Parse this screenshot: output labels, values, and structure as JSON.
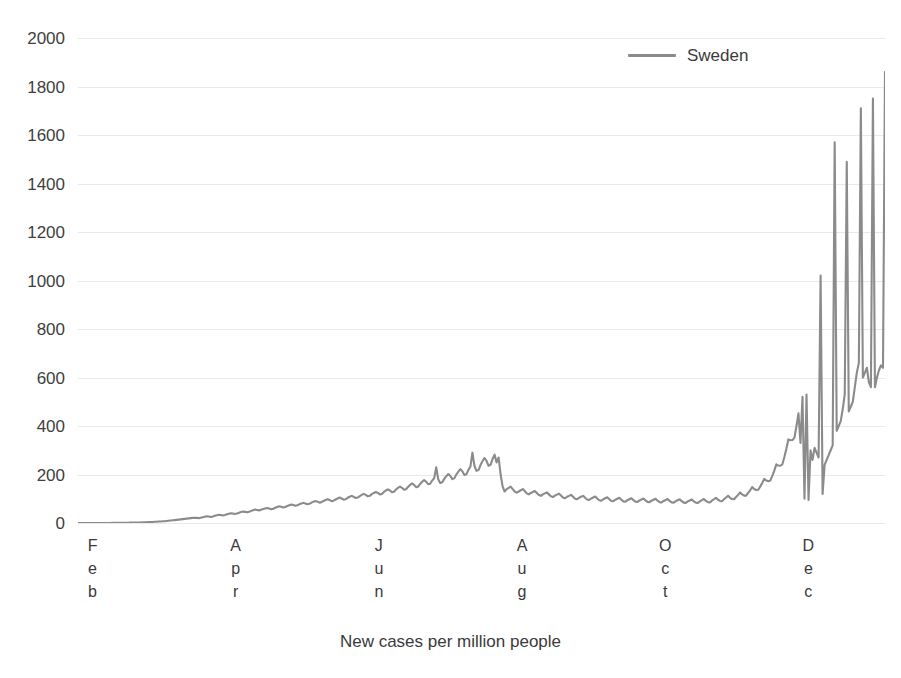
{
  "chart_data": {
    "type": "line",
    "title": "",
    "xlabel": "New cases per million people",
    "ylabel": "",
    "ylim": [
      0,
      2000
    ],
    "ytick_step": 200,
    "yticks": [
      "2000",
      "1800",
      "1600",
      "1400",
      "1200",
      "1000",
      "800",
      "600",
      "400",
      "200",
      "0"
    ],
    "grid": true,
    "legend_position": "top-right",
    "x_tick_labels": [
      "Feb",
      "Apr",
      "Jun",
      "Aug",
      "Oct",
      "Dec"
    ],
    "x_tick_stacked_letters": [
      [
        "F",
        "e",
        "b"
      ],
      [
        "A",
        "p",
        "r"
      ],
      [
        "J",
        "u",
        "n"
      ],
      [
        "A",
        "u",
        "g"
      ],
      [
        "O",
        "c",
        "t"
      ],
      [
        "D",
        "e",
        "c"
      ]
    ],
    "x_range_note": "Feb 2020 through late Dec 2020, daily values",
    "series": [
      {
        "name": "Sweden",
        "color": "#8b8b8b",
        "values": [
          0,
          0,
          0,
          0,
          0,
          0,
          0,
          0,
          0,
          0,
          0,
          0,
          0,
          0,
          0,
          0,
          0,
          1,
          1,
          1,
          1,
          1,
          1,
          1,
          1,
          1,
          2,
          2,
          2,
          2,
          2,
          2,
          3,
          3,
          3,
          4,
          4,
          4,
          5,
          5,
          6,
          6,
          7,
          7,
          8,
          9,
          10,
          11,
          12,
          13,
          14,
          15,
          16,
          17,
          18,
          19,
          20,
          21,
          22,
          21,
          20,
          22,
          24,
          26,
          28,
          27,
          25,
          27,
          30,
          32,
          34,
          33,
          31,
          33,
          36,
          38,
          40,
          39,
          37,
          39,
          42,
          45,
          47,
          46,
          44,
          46,
          50,
          53,
          56,
          54,
          52,
          55,
          58,
          60,
          62,
          60,
          57,
          59,
          63,
          66,
          69,
          67,
          64,
          66,
          70,
          73,
          76,
          74,
          71,
          73,
          77,
          80,
          83,
          80,
          77,
          79,
          84,
          88,
          91,
          88,
          84,
          86,
          91,
          95,
          98,
          95,
          90,
          92,
          97,
          101,
          105,
          101,
          96,
          98,
          104,
          108,
          112,
          108,
          103,
          105,
          111,
          116,
          120,
          116,
          110,
          112,
          119,
          124,
          128,
          124,
          118,
          120,
          128,
          134,
          139,
          134,
          127,
          129,
          138,
          145,
          150,
          145,
          137,
          139,
          149,
          157,
          163,
          157,
          148,
          150,
          161,
          170,
          177,
          170,
          160,
          162,
          175,
          185,
          230,
          180,
          165,
          168,
          182,
          193,
          202,
          194,
          181,
          184,
          200,
          212,
          222,
          213,
          198,
          201,
          219,
          233,
          290,
          235,
          215,
          218,
          239,
          255,
          268,
          256,
          236,
          240,
          264,
          282,
          250,
          270,
          200,
          150,
          130,
          140,
          145,
          150,
          140,
          130,
          125,
          130,
          135,
          140,
          132,
          122,
          118,
          124,
          128,
          132,
          124,
          115,
          112,
          118,
          122,
          126,
          118,
          110,
          107,
          113,
          117,
          121,
          113,
          105,
          102,
          108,
          112,
          116,
          108,
          100,
          98,
          104,
          108,
          112,
          104,
          97,
          95,
          101,
          105,
          109,
          101,
          94,
          92,
          98,
          102,
          106,
          98,
          91,
          90,
          96,
          100,
          104,
          96,
          89,
          88,
          94,
          98,
          102,
          94,
          88,
          87,
          93,
          97,
          101,
          93,
          87,
          86,
          92,
          96,
          100,
          92,
          86,
          85,
          91,
          95,
          99,
          91,
          85,
          84,
          90,
          94,
          98,
          90,
          84,
          83,
          89,
          93,
          97,
          89,
          84,
          83,
          89,
          94,
          99,
          91,
          86,
          85,
          92,
          98,
          104,
          96,
          91,
          90,
          98,
          105,
          112,
          104,
          99,
          98,
          107,
          116,
          126,
          118,
          113,
          113,
          124,
          135,
          148,
          140,
          136,
          137,
          150,
          165,
          182,
          175,
          172,
          175,
          194,
          216,
          242,
          237,
          236,
          242,
          272,
          306,
          345,
          341,
          342,
          352,
          399,
          452,
          330,
          520,
          100,
          530,
          95,
          300,
          260,
          310,
          290,
          270,
          1020,
          120,
          240,
          260,
          280,
          300,
          320,
          1570,
          380,
          400,
          420,
          470,
          530,
          1490,
          460,
          480,
          500,
          560,
          620,
          660,
          1710,
          600,
          620,
          640,
          580,
          560,
          1750,
          560,
          600,
          630,
          650,
          640,
          1860
        ]
      }
    ],
    "peaks_noted": [
      {
        "label": "late June spike",
        "value": 290
      },
      {
        "label": "Nov spike",
        "value": 1020
      },
      {
        "label": "Dec spike 1",
        "value": 1570
      },
      {
        "label": "Dec spike 2",
        "value": 1490
      },
      {
        "label": "Dec spike 3",
        "value": 1710
      },
      {
        "label": "Dec spike 4",
        "value": 1750
      },
      {
        "label": "final Dec spike",
        "value": 1860
      }
    ]
  },
  "legend": {
    "entries": [
      {
        "label": "Sweden",
        "color": "#8b8b8b"
      }
    ]
  },
  "axis_title": "New cases per million people",
  "clipped_header": ""
}
